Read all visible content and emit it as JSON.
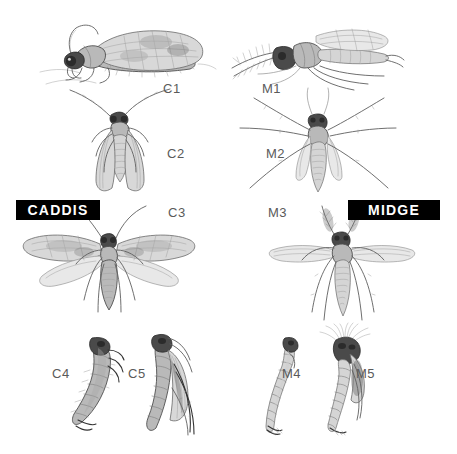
{
  "plate": {
    "title": "Caddis and Midge life stage comparison plate",
    "background_color": "#ffffff",
    "width": 457,
    "height": 454
  },
  "banners": [
    {
      "id": "caddis-banner",
      "label": "CADDIS",
      "bg": "#000000",
      "fg": "#ffffff",
      "x": 16,
      "y": 200,
      "w": 84,
      "h": 20
    },
    {
      "id": "midge-banner",
      "label": "MIDGE",
      "bg": "#000000",
      "fg": "#ffffff",
      "x": 348,
      "y": 200,
      "w": 92,
      "h": 20
    }
  ],
  "caddis_figures": [
    {
      "code": "C1",
      "name": "caddis-adult-lateral",
      "label_x": 163,
      "label_y": 81
    },
    {
      "code": "C2",
      "name": "caddis-adult-dorsal-folded",
      "label_x": 167,
      "label_y": 146
    },
    {
      "code": "C3",
      "name": "caddis-adult-dorsal-spread",
      "label_x": 168,
      "label_y": 205
    },
    {
      "code": "C4",
      "name": "caddis-larva",
      "label_x": 52,
      "label_y": 366
    },
    {
      "code": "C5",
      "name": "caddis-pupa",
      "label_x": 128,
      "label_y": 366
    }
  ],
  "midge_figures": [
    {
      "code": "M1",
      "name": "midge-adult-lateral",
      "label_x": 262,
      "label_y": 81
    },
    {
      "code": "M2",
      "name": "midge-adult-dorsal",
      "label_x": 266,
      "label_y": 146
    },
    {
      "code": "M3",
      "name": "midge-adult-dorsal-spread",
      "label_x": 268,
      "label_y": 205
    },
    {
      "code": "M4",
      "name": "midge-larva",
      "label_x": 282,
      "label_y": 366
    },
    {
      "code": "M5",
      "name": "midge-pupa",
      "label_x": 356,
      "label_y": 366
    }
  ],
  "style": {
    "label_color": "#5a5a5a",
    "ink_dark": "#2b2b2b",
    "ink_mid": "#6e6e6e",
    "ink_light": "#a8a8a8"
  }
}
